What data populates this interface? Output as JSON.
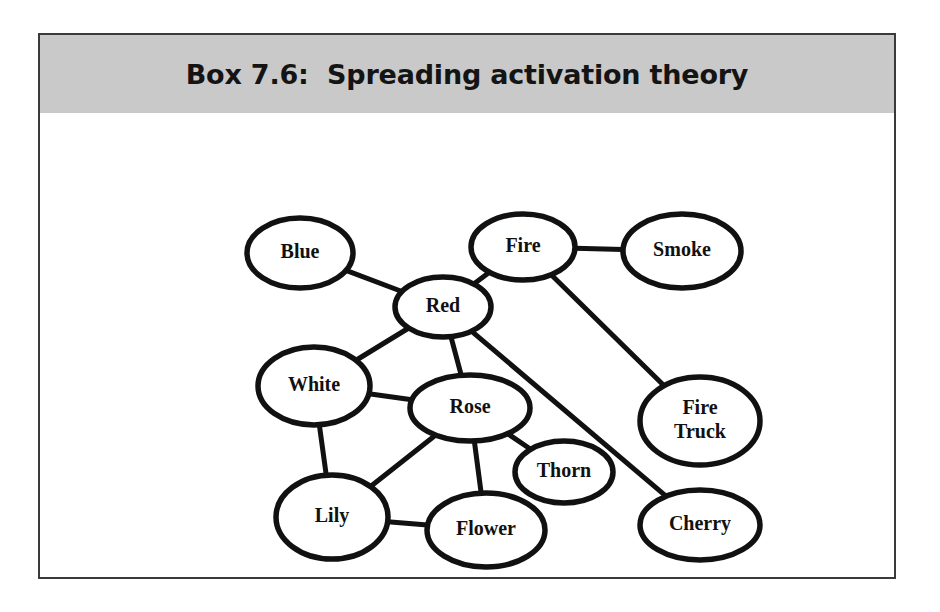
{
  "figure": {
    "title": "Box 7.6:  Spreading activation theory",
    "header_background": "#c9c9c9",
    "border_color": "#3a3a3a",
    "page_background": "#ffffff"
  },
  "diagram": {
    "type": "semantic-network",
    "node_fill": "#ffffff",
    "node_stroke": "#111111",
    "edge_color": "#111111",
    "nodes": [
      {
        "id": "blue",
        "label": "Blue",
        "lines": [
          "Blue"
        ],
        "cx": 260,
        "cy": 140,
        "rx": 53,
        "ry": 35
      },
      {
        "id": "fire",
        "label": "Fire",
        "lines": [
          "Fire"
        ],
        "cx": 483,
        "cy": 134,
        "rx": 52,
        "ry": 33
      },
      {
        "id": "smoke",
        "label": "Smoke",
        "lines": [
          "Smoke"
        ],
        "cx": 642,
        "cy": 138,
        "rx": 59,
        "ry": 37
      },
      {
        "id": "red",
        "label": "Red",
        "lines": [
          "Red"
        ],
        "cx": 403,
        "cy": 194,
        "rx": 48,
        "ry": 30
      },
      {
        "id": "white",
        "label": "White",
        "lines": [
          "White"
        ],
        "cx": 274,
        "cy": 273,
        "rx": 56,
        "ry": 39
      },
      {
        "id": "rose",
        "label": "Rose",
        "lines": [
          "Rose"
        ],
        "cx": 430,
        "cy": 295,
        "rx": 60,
        "ry": 33
      },
      {
        "id": "firetruck",
        "label": "Fire Truck",
        "lines": [
          "Fire",
          "Truck"
        ],
        "cx": 660,
        "cy": 308,
        "rx": 60,
        "ry": 44
      },
      {
        "id": "thorn",
        "label": "Thorn",
        "lines": [
          "Thorn"
        ],
        "cx": 524,
        "cy": 359,
        "rx": 49,
        "ry": 31
      },
      {
        "id": "lily",
        "label": "Lily",
        "lines": [
          "Lily"
        ],
        "cx": 292,
        "cy": 404,
        "rx": 56,
        "ry": 42
      },
      {
        "id": "flower",
        "label": "Flower",
        "lines": [
          "Flower"
        ],
        "cx": 446,
        "cy": 417,
        "rx": 59,
        "ry": 37
      },
      {
        "id": "cherry",
        "label": "Cherry",
        "lines": [
          "Cherry"
        ],
        "cx": 660,
        "cy": 412,
        "rx": 60,
        "ry": 35
      }
    ],
    "edges": [
      {
        "from": "blue",
        "to": "red"
      },
      {
        "from": "red",
        "to": "fire"
      },
      {
        "from": "fire",
        "to": "smoke"
      },
      {
        "from": "fire",
        "to": "firetruck"
      },
      {
        "from": "red",
        "to": "white"
      },
      {
        "from": "red",
        "to": "rose"
      },
      {
        "from": "red",
        "to": "cherry"
      },
      {
        "from": "white",
        "to": "rose"
      },
      {
        "from": "white",
        "to": "lily"
      },
      {
        "from": "rose",
        "to": "lily"
      },
      {
        "from": "rose",
        "to": "flower"
      },
      {
        "from": "rose",
        "to": "thorn"
      },
      {
        "from": "lily",
        "to": "flower"
      }
    ]
  }
}
